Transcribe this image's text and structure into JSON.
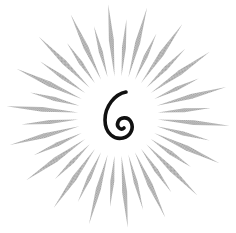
{
  "emblem": {
    "digit": "6",
    "ray_color": "#b3b3b3",
    "digit_color": "#111111",
    "background": "#ffffff",
    "ray_count": 36
  }
}
